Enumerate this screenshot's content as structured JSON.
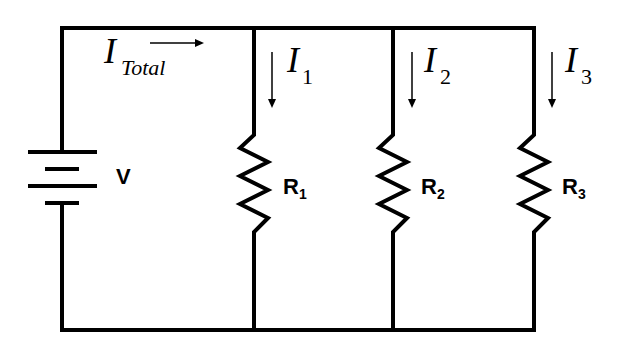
{
  "diagram": {
    "source": {
      "label": "V",
      "type": "battery"
    },
    "total_current": {
      "symbol": "I",
      "subscript": "Total",
      "direction": "right"
    },
    "branches": [
      {
        "resistor": "R",
        "resistor_sub": "1",
        "current": "I",
        "current_sub": "1",
        "direction": "down"
      },
      {
        "resistor": "R",
        "resistor_sub": "2",
        "current": "I",
        "current_sub": "2",
        "direction": "down"
      },
      {
        "resistor": "R",
        "resistor_sub": "3",
        "current": "I",
        "current_sub": "3",
        "direction": "down"
      }
    ],
    "colors": {
      "line": "#000000",
      "background": "#ffffff"
    }
  }
}
